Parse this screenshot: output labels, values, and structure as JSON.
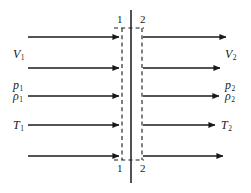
{
  "figure": {
    "type": "normal-shock-control-volume-diagram",
    "background": "#ffffff",
    "line_color": "#1a1a1a",
    "width": 251,
    "height": 193
  },
  "stations": {
    "top_left_number": "1",
    "top_right_number": "2",
    "bottom_left_number": "1",
    "bottom_right_number": "2"
  },
  "upstream": {
    "velocity": {
      "symbol": "V",
      "subscript": "1"
    },
    "pressure": {
      "symbol": "p",
      "subscript": "1"
    },
    "density": {
      "symbol": "ρ",
      "subscript": "1"
    },
    "temperature": {
      "symbol": "T",
      "subscript": "1"
    }
  },
  "downstream": {
    "velocity": {
      "symbol": "V",
      "subscript": "2"
    },
    "pressure": {
      "symbol": "p",
      "subscript": "2"
    },
    "density": {
      "symbol": "ρ",
      "subscript": "2"
    },
    "temperature": {
      "symbol": "T",
      "subscript": "2"
    }
  }
}
